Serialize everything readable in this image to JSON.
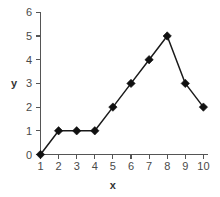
{
  "chart_data": {
    "type": "line",
    "title": "",
    "xlabel": "x",
    "ylabel": "y",
    "x": [
      1,
      2,
      3,
      4,
      5,
      6,
      7,
      8,
      9,
      10
    ],
    "values": [
      0,
      1,
      1,
      1,
      2,
      3,
      4,
      5,
      3,
      2
    ],
    "series": [
      {
        "name": "",
        "values": [
          0,
          1,
          1,
          1,
          2,
          3,
          4,
          5,
          3,
          2
        ]
      }
    ],
    "xtick_labels": [
      "1",
      "2",
      "3",
      "4",
      "5",
      "6",
      "7",
      "8",
      "9",
      "10"
    ],
    "ytick_labels": [
      "0",
      "1",
      "2",
      "3",
      "4",
      "5",
      "6"
    ],
    "xlim": [
      1,
      10
    ],
    "ylim": [
      0,
      6
    ],
    "grid": false,
    "legend": false,
    "legend_position": "none",
    "marker": "diamond",
    "line_color": "#1a1a1a",
    "marker_color": "#111111",
    "axis_color": "#555555",
    "background_color": "#ffffff"
  }
}
